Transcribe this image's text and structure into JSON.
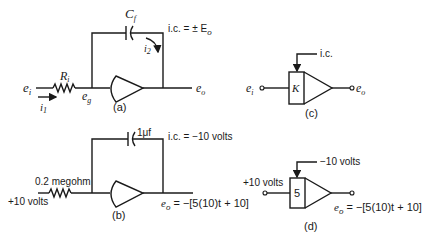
{
  "figure": {
    "panel_a": {
      "caption": "(a)",
      "input_label": "e",
      "input_sub": "i",
      "current_in_label": "i",
      "current_in_sub": "1",
      "resistor_label": "R",
      "resistor_sub": "i",
      "node_label": "e",
      "node_sub": "g",
      "capacitor_label": "C",
      "capacitor_sub": "f",
      "feedback_current_label": "i",
      "feedback_current_sub": "2",
      "ic_label": "i.c. = ± E",
      "ic_sub": "o",
      "output_label": "e",
      "output_sub": "o"
    },
    "panel_b": {
      "caption": "(b)",
      "input_label": "+10 volts",
      "resistor_label": "0.2 megohm",
      "capacitor_label": "1μf",
      "ic_label": "i.c. = −10 volts",
      "output_label": "e",
      "output_sub": "o",
      "output_expr": " = −[5(10)t + 10]"
    },
    "panel_c": {
      "caption": "(c)",
      "input_label": "e",
      "input_sub": "i",
      "gain_label": "K",
      "ic_label": "i.c.",
      "output_label": "e",
      "output_sub": "o"
    },
    "panel_d": {
      "caption": "(d)",
      "input_label": "+10 volts",
      "gain_label": "5",
      "ic_label": "−10 volts",
      "output_label": "e",
      "output_sub": "o",
      "output_expr": " = −[5(10)t + 10]"
    }
  }
}
